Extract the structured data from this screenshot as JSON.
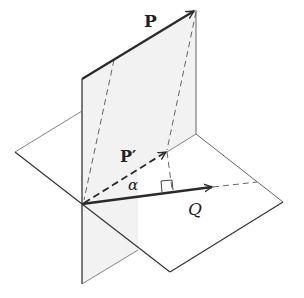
{
  "figure": {
    "labels": {
      "P": "P",
      "P_prime": "P′",
      "alpha": "α",
      "Q": "Q"
    },
    "colors": {
      "vertical_plane_fill": "#f2f2f2",
      "line": "#333333",
      "vector": "#2a2a2a",
      "dashed": "#555555"
    }
  }
}
